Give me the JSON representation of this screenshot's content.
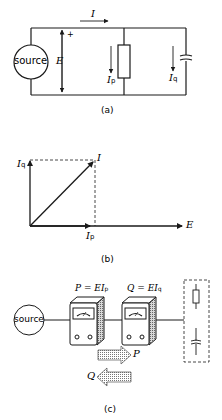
{
  "figure": {
    "panel_a": {
      "caption": "(a)",
      "source_label": "source",
      "current_label": "I",
      "voltage_label": "E",
      "plus_sign": "+",
      "resistor_current_label": "I",
      "resistor_current_sub": "p",
      "capacitor_current_label": "I",
      "capacitor_current_sub": "q"
    },
    "panel_b": {
      "caption": "(b)",
      "vector_I_label": "I",
      "axis_y_label": "I",
      "axis_y_sub": "q",
      "axis_x_label": "E",
      "component_x_label": "I",
      "component_x_sub": "p"
    },
    "panel_c": {
      "caption": "(c)",
      "source_label": "source",
      "meter1_formula_lhs": "P = EI",
      "meter1_formula_sub": "p",
      "meter2_formula_lhs": "Q = EI",
      "meter2_formula_sub": "q",
      "arrow_right_label": "P",
      "arrow_left_label": "Q"
    }
  },
  "colors": {
    "line": "#1a1a1a",
    "background": "#ffffff",
    "shade": "#9a9a9a"
  }
}
